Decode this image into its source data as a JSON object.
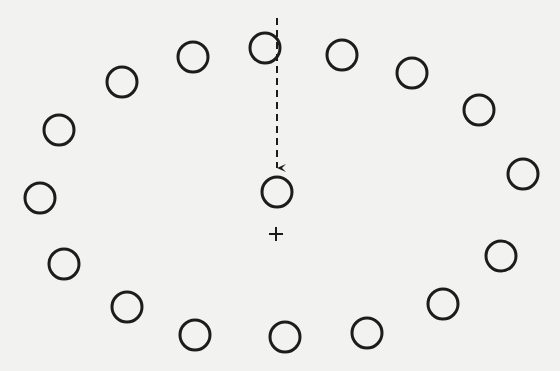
{
  "diagram": {
    "background": "#f2f2f1",
    "ink": "#1c1c1c",
    "ring_radius": 15,
    "ring_stroke_width": 3,
    "outer_circles": [
      {
        "x": 265,
        "y": 48
      },
      {
        "x": 342,
        "y": 55
      },
      {
        "x": 412,
        "y": 73
      },
      {
        "x": 479,
        "y": 110
      },
      {
        "x": 523,
        "y": 174
      },
      {
        "x": 501,
        "y": 256
      },
      {
        "x": 443,
        "y": 304
      },
      {
        "x": 367,
        "y": 333
      },
      {
        "x": 285,
        "y": 337
      },
      {
        "x": 195,
        "y": 335
      },
      {
        "x": 127,
        "y": 307
      },
      {
        "x": 64,
        "y": 264
      },
      {
        "x": 40,
        "y": 198
      },
      {
        "x": 59,
        "y": 130
      },
      {
        "x": 122,
        "y": 82
      },
      {
        "x": 193,
        "y": 57
      }
    ],
    "center_circle": {
      "x": 277,
      "y": 192
    },
    "arrow": {
      "x": 277,
      "y_start": 18,
      "y_end": 176,
      "style": "dashed",
      "dash": "7,5"
    },
    "center_marker": {
      "x": 276,
      "y": 234,
      "glyph": "+",
      "size": 7
    }
  }
}
